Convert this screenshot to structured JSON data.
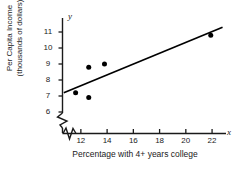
{
  "chart_data": {
    "type": "scatter",
    "title": "",
    "xlabel": "Percentage with 4+ years college",
    "ylabel": "Per Capita Income (thousands of dollars)",
    "ylabel_line1": "Per Capita Income",
    "ylabel_line2": "(thousands of dollars)",
    "x_axis_letter": "x",
    "y_axis_letter": "y",
    "xlim": [
      10.6,
      23.2
    ],
    "ylim": [
      5.5,
      11.6
    ],
    "x_ticks": [
      12,
      14,
      16,
      18,
      20,
      22
    ],
    "y_ticks": [
      6,
      7,
      8,
      9,
      10,
      11
    ],
    "x_tick_labels": [
      "12",
      "14",
      "16",
      "18",
      "20",
      "22"
    ],
    "y_tick_labels": [
      "6",
      "7",
      "8",
      "9",
      "10",
      "11"
    ],
    "grid": false,
    "legend": false,
    "axis_break_x": true,
    "axis_break_y": true,
    "points": [
      {
        "x": 11.6,
        "y": 7.2
      },
      {
        "x": 12.6,
        "y": 6.9
      },
      {
        "x": 12.6,
        "y": 8.8
      },
      {
        "x": 13.8,
        "y": 9.0
      },
      {
        "x": 21.9,
        "y": 10.8
      }
    ],
    "series": [
      {
        "name": "data points",
        "x": [
          11.6,
          12.6,
          12.6,
          13.8,
          21.9
        ],
        "values": [
          7.2,
          6.9,
          8.8,
          9.0,
          10.8
        ],
        "marker": "filled-circle",
        "color": "#000000"
      }
    ],
    "trend_line": {
      "name": "regression-line",
      "x_start": 10.7,
      "y_start": 7.2,
      "x_end": 22.8,
      "y_end": 11.3,
      "color": "#000000"
    }
  },
  "colors": {
    "background": "#ffffff",
    "foreground": "#1a1a1a",
    "marker": "#000000",
    "line": "#000000"
  }
}
